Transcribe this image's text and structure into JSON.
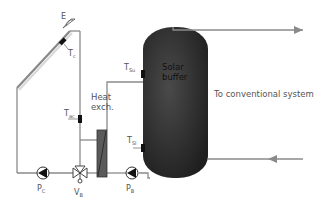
{
  "diagram": {
    "collector": {
      "label": "E",
      "sensor": {
        "main": "T",
        "sub": "c"
      }
    },
    "sensors": {
      "tac": {
        "main": "T",
        "sub": "ac"
      },
      "tsu": {
        "main": "T",
        "sub": "Su"
      },
      "tsl": {
        "main": "T",
        "sub": "Sl"
      }
    },
    "heat_exchanger": {
      "line1": "Heat",
      "line2": "exch."
    },
    "tank": {
      "line1": "Solar",
      "line2": "buffer"
    },
    "pumps": {
      "pc": {
        "main": "P",
        "sub": "C"
      },
      "pb": {
        "main": "P",
        "sub": "B"
      }
    },
    "valve": {
      "main": "V",
      "sub": "B"
    },
    "outlet_label": "To conventional system",
    "colors": {
      "pipe": "#8a8a8a",
      "tank": "#2e2e2e",
      "text": "#555555"
    }
  }
}
